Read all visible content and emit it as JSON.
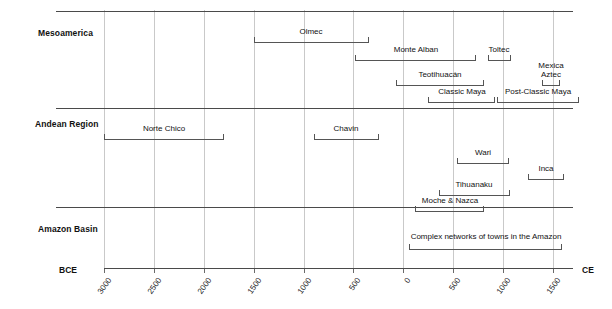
{
  "chart_data": {
    "type": "timeline",
    "title": "",
    "xlabel": "",
    "ylabel": "",
    "grid": true,
    "axis": {
      "left_era_label": "BCE",
      "right_era_label": "CE",
      "xlim": [
        -3000,
        1700
      ],
      "tick_step": 500,
      "ticks": [
        {
          "year": -3000,
          "label": "3000"
        },
        {
          "year": -2500,
          "label": "2500"
        },
        {
          "year": -2000,
          "label": "2000"
        },
        {
          "year": -1500,
          "label": "1500"
        },
        {
          "year": -1000,
          "label": "1000"
        },
        {
          "year": -500,
          "label": "500"
        },
        {
          "year": 0,
          "label": "0"
        },
        {
          "year": 500,
          "label": "500"
        },
        {
          "year": 1000,
          "label": "1000"
        },
        {
          "year": 1500,
          "label": "1500"
        }
      ]
    },
    "rows": [
      {
        "label": "Mesoamerica",
        "bars": [
          {
            "name": "Olmec",
            "start": -1500,
            "end": -350,
            "lane": 0
          },
          {
            "name": "Monte Alban",
            "start": -480,
            "end": 730,
            "lane": 1
          },
          {
            "name": "Toltec",
            "start": 845,
            "end": 1080,
            "lane": 1
          },
          {
            "name": "Teotihuacán",
            "start": -70,
            "end": 810,
            "lane": 2
          },
          {
            "name": "Mexica\nAztec",
            "start": 1385,
            "end": 1570,
            "lane": 2
          },
          {
            "name": "Classic Maya",
            "start": 250,
            "end": 920,
            "lane": 3
          },
          {
            "name": "Post-Classic Maya",
            "start": 940,
            "end": 1760,
            "lane": 3
          }
        ]
      },
      {
        "label": "Andean Region",
        "bars": [
          {
            "name": "Norte Chico",
            "start": -3000,
            "end": -1800,
            "lane": 0
          },
          {
            "name": "Chavin",
            "start": -900,
            "end": -250,
            "lane": 0
          },
          {
            "name": "Wari",
            "start": 540,
            "end": 1065,
            "lane": 1
          },
          {
            "name": "Inca",
            "start": 1250,
            "end": 1615,
            "lane": 2
          },
          {
            "name": "Tihuanaku",
            "start": 355,
            "end": 1065,
            "lane": 3
          },
          {
            "name": "Moche & Nazca",
            "start": 120,
            "end": 810,
            "lane": 4
          }
        ]
      },
      {
        "label": "Amazon Basin",
        "bars": [
          {
            "name": "Complex networks of towns in the Amazon",
            "start": 60,
            "end": 1590,
            "lane": 0
          }
        ]
      }
    ]
  },
  "colors": {
    "rule": "#4a4a4a",
    "grid": "#c9c9c9",
    "bar": "#555555",
    "text": "#111111",
    "background": "#ffffff"
  }
}
